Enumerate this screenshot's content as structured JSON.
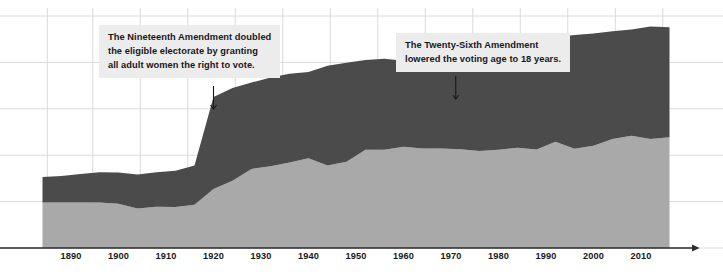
{
  "chart_data": {
    "type": "area",
    "title": "",
    "subtitle": "",
    "xlabel": "",
    "ylabel": "",
    "stacked": true,
    "grid": true,
    "legend_position": "none",
    "xlim": [
      1884,
      2016
    ],
    "ylim": [
      0,
      1.0
    ],
    "x_ticks": [
      1890,
      1900,
      1910,
      1920,
      1930,
      1940,
      1950,
      1960,
      1970,
      1980,
      1990,
      2000,
      2010
    ],
    "y_ticks": [],
    "colors": {
      "voted": "#a9a9a9",
      "eligible_not_voted": "#4b4b4b",
      "grid": "#d6d6d6",
      "axis": "#2b2b2b",
      "annotation_bg": "#ececec",
      "text": "#17181c"
    },
    "series": [
      {
        "name": "Votes cast",
        "key": "voted",
        "color": "#a9a9a9",
        "x": [
          1884,
          1888,
          1892,
          1896,
          1900,
          1904,
          1908,
          1912,
          1916,
          1920,
          1924,
          1928,
          1932,
          1936,
          1940,
          1944,
          1948,
          1952,
          1956,
          1960,
          1964,
          1968,
          1972,
          1976,
          1980,
          1984,
          1988,
          1992,
          1996,
          2000,
          2004,
          2008,
          2012,
          2016
        ],
        "values": [
          0.196,
          0.196,
          0.196,
          0.196,
          0.191,
          0.17,
          0.178,
          0.177,
          0.186,
          0.254,
          0.29,
          0.341,
          0.352,
          0.368,
          0.387,
          0.356,
          0.372,
          0.424,
          0.424,
          0.436,
          0.429,
          0.429,
          0.426,
          0.418,
          0.423,
          0.432,
          0.425,
          0.458,
          0.428,
          0.441,
          0.47,
          0.484,
          0.47,
          0.477
        ]
      },
      {
        "name": "Eligible but did not vote",
        "key": "eligible_not_voted",
        "color": "#4b4b4b",
        "x": [
          1884,
          1888,
          1892,
          1896,
          1900,
          1904,
          1908,
          1912,
          1916,
          1920,
          1924,
          1928,
          1932,
          1936,
          1940,
          1944,
          1948,
          1952,
          1956,
          1960,
          1964,
          1968,
          1972,
          1976,
          1980,
          1984,
          1988,
          1992,
          1996,
          2000,
          2004,
          2008,
          2012,
          2016
        ],
        "values": [
          0.11,
          0.114,
          0.123,
          0.13,
          0.134,
          0.147,
          0.148,
          0.156,
          0.17,
          0.397,
          0.4,
          0.372,
          0.383,
          0.383,
          0.372,
          0.43,
          0.427,
          0.386,
          0.392,
          0.371,
          0.386,
          0.387,
          0.43,
          0.452,
          0.455,
          0.455,
          0.474,
          0.451,
          0.49,
          0.484,
          0.464,
          0.458,
          0.485,
          0.474
        ]
      }
    ],
    "annotations": [
      {
        "id": "nineteenth-amendment",
        "text": "The Nineteenth Amendment doubled\nthe eligible electorate by granting\nall adult women the right to vote.",
        "pointer_year": 1920,
        "arrow": "down"
      },
      {
        "id": "twenty-sixth-amendment",
        "text": "The Twenty-Sixth Amendment\nlowered the voting age to 18 years.",
        "pointer_year": 1971,
        "arrow": "down"
      }
    ]
  },
  "axis": {
    "ticks": [
      {
        "label": "1890"
      },
      {
        "label": "1900"
      },
      {
        "label": "1910"
      },
      {
        "label": "1920"
      },
      {
        "label": "1930"
      },
      {
        "label": "1940"
      },
      {
        "label": "1950"
      },
      {
        "label": "1960"
      },
      {
        "label": "1970"
      },
      {
        "label": "1980"
      },
      {
        "label": "1990"
      },
      {
        "label": "2000"
      },
      {
        "label": "2010"
      }
    ]
  },
  "annotations": {
    "nineteenth": "The Nineteenth Amendment doubled\nthe eligible electorate by granting\nall adult women the right to vote.",
    "twentysixth": "The Twenty-Sixth Amendment\nlowered the voting age to 18 years."
  }
}
